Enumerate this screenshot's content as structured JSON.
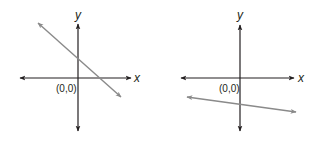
{
  "diagram": {
    "colors": {
      "axis": "#231f20",
      "line": "#8a8a8a",
      "background": "#ffffff"
    },
    "graphs": [
      {
        "id": "left",
        "x_label": "x",
        "y_label": "y",
        "origin_label": "(0,0)",
        "line": {
          "description": "Line with negative slope, positive y-intercept, positive x-intercept",
          "slope_sign": "negative",
          "y_intercept_sign": "positive"
        }
      },
      {
        "id": "right",
        "x_label": "x",
        "y_label": "y",
        "origin_label": "(0,0)",
        "line": {
          "description": "Line with slight negative slope, negative y-intercept",
          "slope_sign": "negative",
          "y_intercept_sign": "negative"
        }
      }
    ]
  }
}
